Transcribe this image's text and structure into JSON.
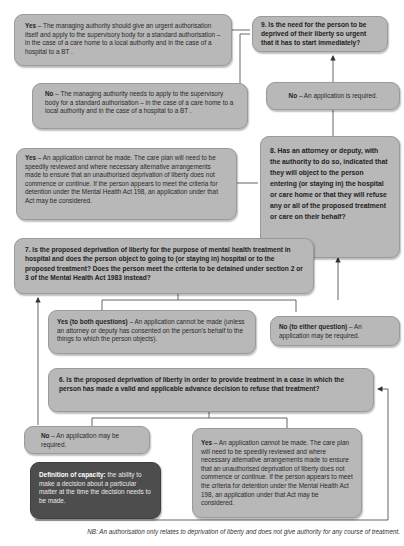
{
  "flowchart": {
    "q9": {
      "text": "9. Is the need for the person to be deprived of their liberty so urgent that it has to start immediately?"
    },
    "q9_yes": {
      "label": "Yes",
      "text": " – The managing authority should give an urgent authorisation itself and apply to the supervisory body for a standard authorisation – in the case of a care home to a local authority and in the case of a hospital to a BT ."
    },
    "q9_no": {
      "label": "No",
      "text": " – The managing authority needs to apply to the supervisory body for a standard authorisation – in the case of a care home to a local authority and in the case of a hospital to a BT ."
    },
    "q8_no": {
      "label": "No",
      "text": " – An application is required."
    },
    "q8": {
      "text": "8. Has an attorney or deputy, with the authority to do so, indicated that they will object to the person entering (or staying in) the hospital or care home or that they will refuse any or all of the proposed treatment or care on their behalf?"
    },
    "q8_yes": {
      "label": "Yes",
      "text": " – An application cannot be made. The care plan will need to be speedily reviewed and where necessary alternative arrangements made to ensure that an unauthorised deprivation of liberty does not commence or continue. If the person appears to meet the criteria for detention under the Mental Health Act 198, an application under that Act may be considered."
    },
    "q7": {
      "text": "7. Is the proposed deprivation of liberty for the purpose of mental health treatment in hospital and does the person object to going to (or staying in) hospital or to the proposed treatment? Does the person meet the criteria to be detained under section 2 or 3 of the Mental Health Act 1983 instead?"
    },
    "q7_yes": {
      "label": "Yes (to both questions)",
      "text": " – An application cannot be made (unless an attorney or deputy has consented on the person's behalf to the things to which the person objects)."
    },
    "q7_no": {
      "label": "No (to either question)",
      "text": " – An application may be required."
    },
    "q6": {
      "text": "6. Is the proposed deprivation of liberty in order to provide treatment in a case in which the person has made a valid and applicable advance decision to refuse that treatment?"
    },
    "q6_no": {
      "label": "No",
      "text": " – An application may be required."
    },
    "q6_yes": {
      "label": "Yes",
      "text": " – An application cannot be made. The care plan will need to be speedily reviewed and where necessary alternative arrangements made to ensure that an unauthorised deprivation of liberty does not commence or continue. If the person appears to meet the criteria for detention under the Mental Health Act 198, an application under that Act may be considered."
    },
    "definition": {
      "label": "Definition of capacity:",
      "text": " the ability to make a decision about a particular matter at the time the decision needs to be made."
    }
  },
  "footnote": "NB: An authorisation only relates to deprivation of liberty and does not give authority for any course of treatment.",
  "colors": {
    "box_fill": "#b8b8b8",
    "dark_box_fill": "#4d4d4d",
    "line": "#555555"
  }
}
